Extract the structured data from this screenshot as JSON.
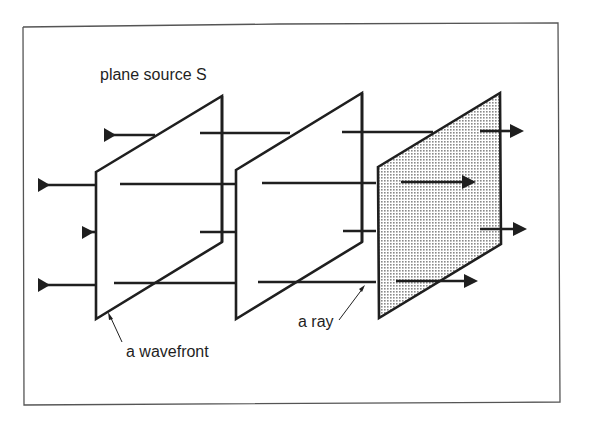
{
  "figure": {
    "labels": {
      "source": "plane source S",
      "wavefront": "a wavefront",
      "ray": "a ray"
    },
    "colors": {
      "ink": "#1f1f1f",
      "frame": "#555555",
      "shading": "#bdbdbd",
      "background": "#ffffff"
    },
    "elements": {
      "wavefronts": 3,
      "rays": 4,
      "shaded_plane_index": 3
    }
  }
}
